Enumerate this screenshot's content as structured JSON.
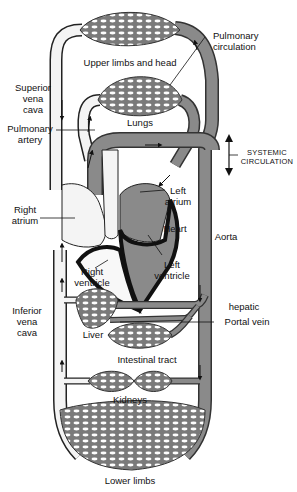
{
  "diagram": {
    "colors": {
      "oxygenated_vessel": "#8a8a8a",
      "deoxygenated_vessel": "#f4f4f4",
      "outline": "#222222",
      "heart_wall": "#111111",
      "background": "#ffffff"
    },
    "labels": {
      "pulmonary_circulation": [
        "Pulmonary",
        "circulation"
      ],
      "upper_limbs_head": "Upper limbs and head",
      "superior_vena_cava": [
        "Superior",
        "vena",
        "cava"
      ],
      "lungs": "Lungs",
      "pulmonary_artery": [
        "Pulmonary",
        "artery"
      ],
      "systemic_circulation": [
        "SYSTEMIC",
        "CIRCULATION"
      ],
      "right_atrium": [
        "Right",
        "atrium"
      ],
      "left_atrium": [
        "Left",
        "atrium"
      ],
      "heart": "Heart",
      "aorta": "Aorta",
      "right_ventricle": [
        "Right",
        "ventricle"
      ],
      "left_ventricle": [
        "Left",
        "ventricle"
      ],
      "inferior_vena_cava": [
        "Inferior",
        "vena",
        "cava"
      ],
      "hepatic": "hepatic",
      "portal_vein": "Portal vein",
      "liver": "Liver",
      "intestinal_tract": "Intestinal tract",
      "kidneys": "Kidneys",
      "lower_limbs": "Lower limbs"
    },
    "capillary_beds": [
      "Upper limbs and head",
      "Lungs",
      "Liver",
      "Intestinal tract",
      "Kidneys",
      "Lower limbs"
    ],
    "heart_chambers": [
      "Right atrium",
      "Left atrium",
      "Right ventricle",
      "Left ventricle"
    ]
  }
}
